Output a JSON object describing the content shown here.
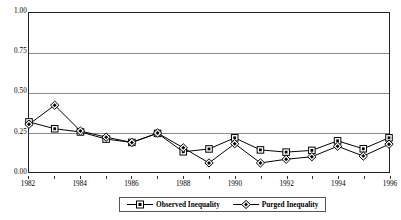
{
  "chart_data": {
    "type": "line",
    "title": "",
    "subtitle": "",
    "xlabel": "",
    "ylabel": "",
    "x": [
      1982,
      1983,
      1984,
      1985,
      1986,
      1987,
      1988,
      1989,
      1990,
      1991,
      1992,
      1993,
      1994,
      1995,
      1996
    ],
    "xlim": [
      1982,
      1996
    ],
    "ylim": [
      0.0,
      1.0
    ],
    "grid": true,
    "legend_position": "bottom-center",
    "series": [
      {
        "name": "Observed Inequality",
        "marker": "open-square",
        "color": "#000000",
        "values": [
          0.315,
          0.272,
          0.252,
          0.207,
          0.186,
          0.243,
          0.127,
          0.145,
          0.215,
          0.139,
          0.125,
          0.136,
          0.196,
          0.146,
          0.215
        ]
      },
      {
        "name": "Purged Inequality",
        "marker": "filled-diamond",
        "color": "#000000",
        "values": [
          0.3,
          0.42,
          0.258,
          0.219,
          0.186,
          0.245,
          0.152,
          0.057,
          0.178,
          0.057,
          0.08,
          0.096,
          0.162,
          0.1,
          0.175
        ]
      }
    ],
    "yticks": [
      "0.00",
      "0.25",
      "0.50",
      "0.75",
      "1.00"
    ],
    "ytick_values": [
      0.0,
      0.25,
      0.5,
      0.75,
      1.0
    ],
    "xticks": [
      "1982",
      "1984",
      "1986",
      "1988",
      "1990",
      "1992",
      "1994",
      "1996"
    ],
    "xtick_values": [
      1982,
      1984,
      1986,
      1988,
      1990,
      1992,
      1994,
      1996
    ]
  },
  "legend": {
    "items": [
      {
        "label": "Observed Inequality",
        "marker": "open-square"
      },
      {
        "label": "Purged Inequality",
        "marker": "filled-diamond"
      }
    ]
  }
}
